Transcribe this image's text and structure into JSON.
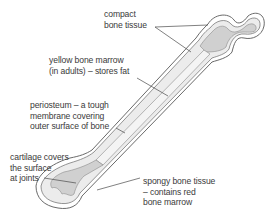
{
  "diagram": {
    "labels": {
      "compact": [
        "compact",
        "bone tissue"
      ],
      "yellow_marrow": [
        "yellow bone marrow",
        "(in adults) – stores fat"
      ],
      "periosteum": [
        "periosteum – a tough",
        "membrane covering",
        "outer surface of bone"
      ],
      "cartilage": [
        "cartilage covers",
        "the surface",
        "at joints"
      ],
      "spongy": [
        "spongy bone tissue",
        "– contains red",
        "bone marrow"
      ]
    },
    "colors": {
      "outline": "#6a6a6a",
      "periosteum_fill": "#ffffff",
      "compact_fill": "#e9e9e9",
      "spongy_fill": "#cfcfcf",
      "text": "#3a3a3a"
    }
  }
}
